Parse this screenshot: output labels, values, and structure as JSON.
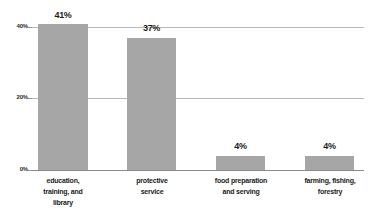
{
  "chart_data": {
    "type": "bar",
    "title": "",
    "subtitle": "",
    "xlabel": "",
    "ylabel": "",
    "categories": [
      "education, training, and library",
      "protective service",
      "food preparation and serving",
      "farming, fishing, forestry"
    ],
    "category_lines": [
      [
        "education,",
        "training, and",
        "library"
      ],
      [
        "protective",
        "service"
      ],
      [
        "food preparation",
        "and serving"
      ],
      [
        "farming, fishing,",
        "forestry"
      ]
    ],
    "values": [
      41,
      37,
      4,
      4
    ],
    "value_labels": [
      "41%",
      "37%",
      "4%",
      "4%"
    ],
    "ylim": [
      0,
      40
    ],
    "yticks": [
      0,
      20,
      40
    ],
    "ytick_labels": [
      "0%",
      "20%",
      "40%"
    ],
    "grid": true,
    "gridlines_at": [
      20,
      40
    ],
    "legend": false,
    "legend_position": "none",
    "orientation": "vertical",
    "bar_color": "#a6a6a6",
    "gridline_color": "#b8b8b8",
    "axis_color": "#8a8a8a",
    "text_color": "#1c1c1c",
    "background": "#ffffff"
  },
  "axis": {
    "y": {
      "tick_40": "40%",
      "tick_20": "20%",
      "tick_0": "0%"
    }
  },
  "bars": [
    {
      "value_label": "41%",
      "line1": "education,",
      "line2": "training, and",
      "line3": "library"
    },
    {
      "value_label": "37%",
      "line1": "protective",
      "line2": "service",
      "line3": ""
    },
    {
      "value_label": "4%",
      "line1": "food preparation",
      "line2": "and serving",
      "line3": ""
    },
    {
      "value_label": "4%",
      "line1": "farming, fishing,",
      "line2": "forestry",
      "line3": ""
    }
  ]
}
